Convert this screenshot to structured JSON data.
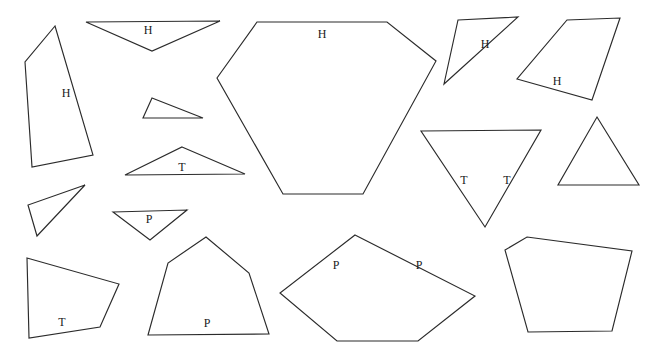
{
  "figure": {
    "background_color": "#ffffff",
    "stroke_color": "#2b2b2b",
    "label_color": "#1a1a1a",
    "width": 647,
    "height": 356,
    "shapes": [
      {
        "name": "shape-quad-h-left",
        "kind": "quadrilateral",
        "label": "H",
        "label_x": 66,
        "label_y": 93,
        "points": "55,26 25,62 32,167 93,155"
      },
      {
        "name": "shape-triangle-h-top",
        "kind": "triangle",
        "label": "H",
        "label_x": 148,
        "label_y": 30,
        "points": "86,22 220,21 152,51"
      },
      {
        "name": "shape-hexagon-h-center",
        "kind": "hexagon",
        "label": "H",
        "label_x": 322,
        "label_y": 34,
        "points": "257,22 387,22 436,61 363,194 283,194 217,78"
      },
      {
        "name": "shape-triangle-h-upper-right",
        "kind": "triangle",
        "label": "H",
        "label_x": 485,
        "label_y": 44,
        "points": "458,20 518,17 444,84"
      },
      {
        "name": "shape-quad-h-right",
        "kind": "quadrilateral",
        "label": "H",
        "label_x": 557,
        "label_y": 81,
        "points": "567,20 620,18 592,100 517,79"
      },
      {
        "name": "shape-triangle-small-sliver",
        "kind": "triangle",
        "label": "",
        "label_x": 0,
        "label_y": 0,
        "points": "152,98 203,118 143,118"
      },
      {
        "name": "shape-triangle-t-left",
        "kind": "triangle",
        "label": "T",
        "label_x": 182,
        "label_y": 167,
        "points": "182,147 245,174 125,175"
      },
      {
        "name": "shape-triangle-t-inverted",
        "kind": "triangle",
        "label": "T",
        "label_x": 464,
        "label_y": 180,
        "label2": "T",
        "label2_x": 507,
        "label2_y": 180,
        "points": "421,131 541,130 485,227"
      },
      {
        "name": "shape-triangle-right-upright",
        "kind": "triangle",
        "label": "",
        "label_x": 0,
        "label_y": 0,
        "points": "597,117 639,185 558,185"
      },
      {
        "name": "shape-triangle-thin-left",
        "kind": "triangle",
        "label": "",
        "label_x": 0,
        "label_y": 0,
        "points": "85,185 28,205 37,236"
      },
      {
        "name": "shape-triangle-p-small",
        "kind": "triangle",
        "label": "P",
        "label_x": 149,
        "label_y": 219,
        "points": "113,212 187,210 150,240"
      },
      {
        "name": "shape-quad-t-bottom-left",
        "kind": "quadrilateral",
        "label": "T",
        "label_x": 62,
        "label_y": 322,
        "points": "27,258 119,284 100,327 29,338"
      },
      {
        "name": "shape-pentagon-p-bottom",
        "kind": "pentagon",
        "label": "P",
        "label_x": 207,
        "label_y": 323,
        "points": "206,237 249,273 269,334 148,335 168,263"
      },
      {
        "name": "shape-pentagon-p-center-bottom",
        "kind": "pentagon",
        "label": "P",
        "label_x": 336,
        "label_y": 265,
        "label2": "P",
        "label2_x": 419,
        "label2_y": 265,
        "points": "355,235 475,296 418,341 337,341 280,293"
      },
      {
        "name": "shape-pentagon-bottom-right",
        "kind": "pentagon",
        "label": "",
        "label_x": 0,
        "label_y": 0,
        "points": "527,237 632,251 612,331 528,332 505,250"
      }
    ]
  }
}
